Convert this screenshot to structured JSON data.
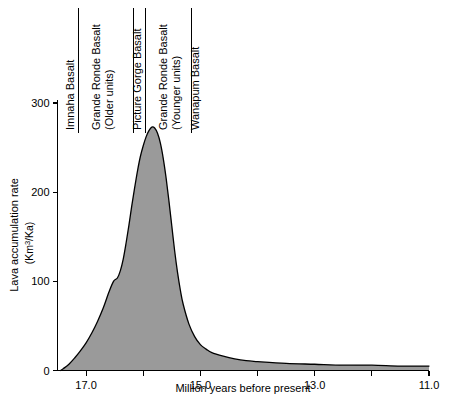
{
  "chart_data": {
    "type": "area",
    "title": "",
    "xlabel": "Million years before present",
    "ylabel": "Lava accumulation rate",
    "ylabel_units": "(Km3/Ka)",
    "ylabel_units_rich": {
      "prefix": "(Km",
      "superscript": "3",
      "suffix": "/Ka)"
    },
    "xlim": [
      17.5,
      11.0
    ],
    "ylim": [
      0,
      320
    ],
    "x_axis_inverted": true,
    "grid": false,
    "legend": "none",
    "xticks_major": [
      "17.0",
      "15.0",
      "13.0",
      "11.0"
    ],
    "xticks_major_values": [
      17.0,
      15.0,
      13.0,
      11.0
    ],
    "xticks_minor_values": [
      16.0,
      14.0,
      12.0
    ],
    "yticks": [
      "0",
      "100",
      "200",
      "300"
    ],
    "ytick_values": [
      0,
      100,
      200,
      300
    ],
    "x": [
      17.45,
      17.4,
      17.3,
      17.2,
      17.1,
      17.0,
      16.9,
      16.8,
      16.7,
      16.6,
      16.52,
      16.45,
      16.4,
      16.35,
      16.3,
      16.25,
      16.2,
      16.15,
      16.1,
      16.05,
      16.0,
      15.95,
      15.9,
      15.85,
      15.8,
      15.75,
      15.7,
      15.65,
      15.6,
      15.55,
      15.5,
      15.45,
      15.4,
      15.35,
      15.3,
      15.2,
      15.1,
      15.0,
      14.9,
      14.8,
      14.6,
      14.4,
      14.2,
      14.0,
      13.5,
      13.0,
      12.5,
      12.0,
      11.5,
      11.0
    ],
    "y": [
      0,
      2,
      7,
      14,
      22,
      31,
      42,
      55,
      70,
      88,
      100,
      104,
      112,
      125,
      143,
      163,
      185,
      205,
      224,
      240,
      252,
      262,
      269,
      273,
      272,
      266,
      255,
      238,
      216,
      190,
      162,
      134,
      110,
      90,
      74,
      52,
      38,
      29,
      24,
      20,
      16,
      13,
      11,
      10,
      8,
      7,
      6,
      6,
      5,
      5
    ],
    "peak": {
      "x": 15.85,
      "y": 273
    },
    "shoulder": {
      "x": 16.52,
      "y": 100
    },
    "fill_color": "#9a9a9a",
    "line_color": "#000000",
    "units_note": "Lava accumulation rate in cubic kilometers per thousand years"
  },
  "annotations": {
    "units": [
      {
        "label": "Imnaha Basalt",
        "label_line2": ""
      },
      {
        "label": "Grande Ronde Basalt",
        "label_line2": "(Older units)"
      },
      {
        "label": "Picture Gorge Basalt",
        "label_line2": ""
      },
      {
        "label": "Grande Ronde Basalt",
        "label_line2": "(Younger units)"
      },
      {
        "label": "Wanapum Basalt",
        "label_line2": ""
      }
    ]
  }
}
